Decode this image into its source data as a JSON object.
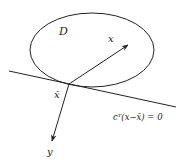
{
  "diagram": {
    "region_label": "D",
    "point_x_label": "x",
    "point_xbar_label": "x̄",
    "point_y_label": "y",
    "hyperplane_label": "cᵀ(x−x̄) = 0"
  },
  "colors": {
    "stroke": "#222222",
    "background": "#ffffff"
  }
}
